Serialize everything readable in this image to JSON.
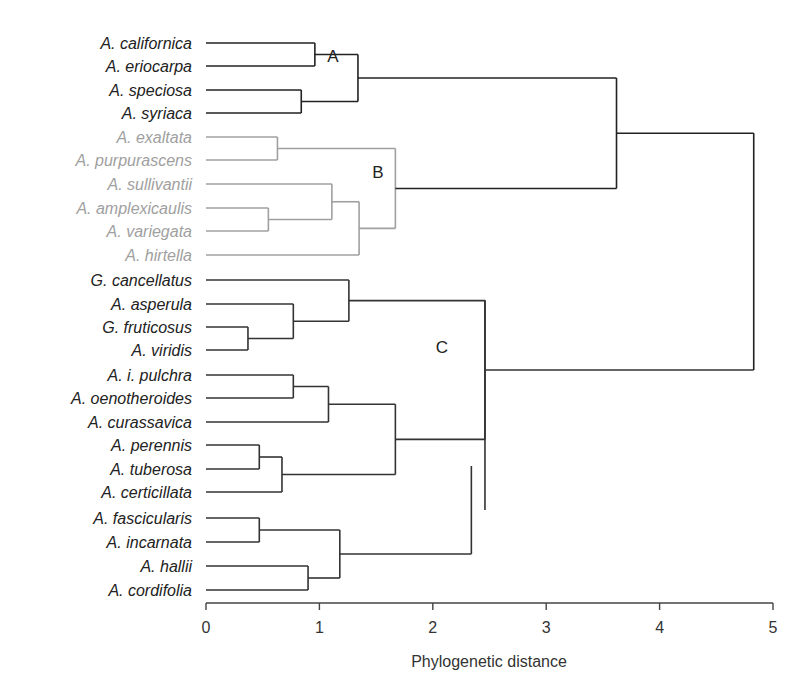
{
  "chart_data": {
    "type": "dendrogram",
    "title": "",
    "xlabel": "Phylogenetic distance",
    "ylabel": "",
    "xlim": [
      0,
      5
    ],
    "x_ticks": [
      0,
      1,
      2,
      3,
      4,
      5
    ],
    "grid": false,
    "colors": {
      "clade_A": "#222222",
      "clade_B": "#a0a0a0",
      "clade_C": "#333333",
      "root": "#222222"
    },
    "clade_labels": [
      {
        "label": "A",
        "x": 1.15,
        "leaf_index": 1.5
      },
      {
        "label": "B",
        "x": 1.53,
        "leaf_index": 5.5
      },
      {
        "label": "C",
        "x": 2.1,
        "leaf_index": 14
      }
    ],
    "leaves": [
      {
        "name": "A. californica",
        "clade": "A"
      },
      {
        "name": "A. eriocarpa",
        "clade": "A"
      },
      {
        "name": "A. speciosa",
        "clade": "A"
      },
      {
        "name": "A. syriaca",
        "clade": "A"
      },
      {
        "name": "A. exaltata",
        "clade": "B"
      },
      {
        "name": "A. purpurascens",
        "clade": "B"
      },
      {
        "name": "A. sullivantii",
        "clade": "B"
      },
      {
        "name": "A. amplexicaulis",
        "clade": "B"
      },
      {
        "name": "A. variegata",
        "clade": "B"
      },
      {
        "name": "A. hirtella",
        "clade": "B"
      },
      {
        "name": "G. cancellatus",
        "clade": "C"
      },
      {
        "name": "A. asperula",
        "clade": "C"
      },
      {
        "name": "G. fruticosus",
        "clade": "C"
      },
      {
        "name": "A. viridis",
        "clade": "C"
      },
      {
        "name": "A. i. pulchra",
        "clade": "C"
      },
      {
        "name": "A. oenotheroides",
        "clade": "C"
      },
      {
        "name": "A. curassavica",
        "clade": "C"
      },
      {
        "name": "A. perennis",
        "clade": "C"
      },
      {
        "name": "A. tuberosa",
        "clade": "C"
      },
      {
        "name": "A. certicillata",
        "clade": "C"
      },
      {
        "name": "A. fascicularis",
        "clade": "C"
      },
      {
        "name": "A. incarnata",
        "clade": "C"
      },
      {
        "name": "A. hallii",
        "clade": "C"
      },
      {
        "name": "A. cordifolia",
        "clade": "C"
      }
    ],
    "merges": [
      {
        "id": "A1",
        "children": [
          "A. californica",
          "A. eriocarpa"
        ],
        "height": 0.96
      },
      {
        "id": "A2",
        "children": [
          "A. speciosa",
          "A. syriaca"
        ],
        "height": 0.84
      },
      {
        "id": "A",
        "children": [
          "A1",
          "A2"
        ],
        "height": 1.34
      },
      {
        "id": "B1",
        "children": [
          "A. exaltata",
          "A. purpurascens"
        ],
        "height": 0.63
      },
      {
        "id": "B2",
        "children": [
          "A. amplexicaulis",
          "A. variegata"
        ],
        "height": 0.55
      },
      {
        "id": "B3",
        "children": [
          "A. sullivantii",
          "B2"
        ],
        "height": 1.11
      },
      {
        "id": "B4",
        "children": [
          "B3",
          "A. hirtella"
        ],
        "height": 1.35
      },
      {
        "id": "B",
        "children": [
          "B1",
          "B4"
        ],
        "height": 1.67
      },
      {
        "id": "AB",
        "children": [
          "A",
          "B"
        ],
        "height": 3.62
      },
      {
        "id": "C1",
        "children": [
          "G. fruticosus",
          "A. viridis"
        ],
        "height": 0.37
      },
      {
        "id": "C2",
        "children": [
          "A. asperula",
          "C1"
        ],
        "height": 0.77
      },
      {
        "id": "C3",
        "children": [
          "G. cancellatus",
          "C2"
        ],
        "height": 1.26
      },
      {
        "id": "C4",
        "children": [
          "A. i. pulchra",
          "A. oenotheroides"
        ],
        "height": 0.77
      },
      {
        "id": "C5",
        "children": [
          "C4",
          "A. curassavica"
        ],
        "height": 1.08
      },
      {
        "id": "C6",
        "children": [
          "A. perennis",
          "A. tuberosa"
        ],
        "height": 0.47
      },
      {
        "id": "C7",
        "children": [
          "C6",
          "A. certicillata"
        ],
        "height": 0.67
      },
      {
        "id": "C8",
        "children": [
          "C5",
          "C7"
        ],
        "height": 1.67
      },
      {
        "id": "C9",
        "children": [
          "A. fascicularis",
          "A. incarnata"
        ],
        "height": 0.47
      },
      {
        "id": "C10",
        "children": [
          "A. hallii",
          "A. cordifolia"
        ],
        "height": 0.9
      },
      {
        "id": "C11",
        "children": [
          "C9",
          "C10"
        ],
        "height": 1.18
      },
      {
        "id": "C12",
        "children": [
          "C11"
        ],
        "height": 2.34,
        "note": "open-ended stem bar"
      },
      {
        "id": "C",
        "children": [
          "C3",
          "C8"
        ],
        "height": 2.46
      },
      {
        "id": "root",
        "children": [
          "AB",
          "C"
        ],
        "height": 4.83
      }
    ]
  }
}
